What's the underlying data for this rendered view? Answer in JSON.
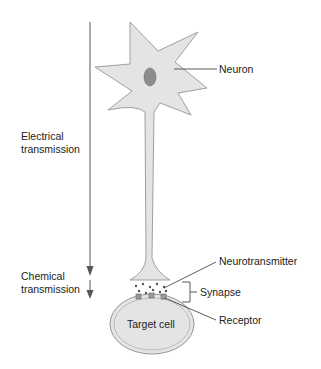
{
  "diagram": {
    "labels": {
      "neuron": "Neuron",
      "electrical": [
        "Electrical",
        "transmission"
      ],
      "chemical": [
        "Chemical",
        "transmission"
      ],
      "neurotransmitter": "Neurotransmitter",
      "synapse": "Synapse",
      "receptor": "Receptor",
      "target_cell": "Target cell"
    },
    "colors": {
      "cell_fill": "#e4e4e4",
      "cell_stroke": "#8a8a8a",
      "nucleus": "#8c8c8c",
      "arrow": "#555555",
      "text": "#222222"
    }
  }
}
